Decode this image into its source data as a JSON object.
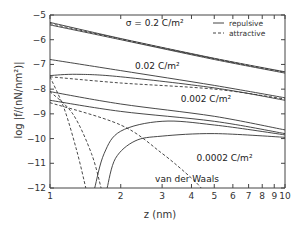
{
  "chart_data": {
    "type": "line",
    "title": "",
    "xlabel": "z (nm)",
    "ylabel": "log |f/(nN/nm²)|",
    "xscale": "log",
    "xlim": [
      1,
      10
    ],
    "ylim": [
      -12,
      -5
    ],
    "x_ticks": [
      "1",
      "2",
      "3",
      "4",
      "5",
      "6",
      "7",
      "8",
      "9",
      "10"
    ],
    "y_ticks": [
      "-5",
      "-6",
      "-7",
      "-8",
      "-9",
      "-10",
      "-11",
      "-12"
    ],
    "grid": false,
    "legend": {
      "position": "upper right",
      "entries": [
        {
          "label": "repulsive",
          "style": "solid"
        },
        {
          "label": "attractive",
          "style": "dashed"
        }
      ]
    },
    "annotations": [
      {
        "text": "σ = 0.2 C/m²",
        "x": 2.1,
        "y": -5.45
      },
      {
        "text": "0.02 C/m²",
        "x": 2.3,
        "y": -7.2
      },
      {
        "text": "0.002 C/m²",
        "x": 3.6,
        "y": -8.5
      },
      {
        "text": "0.0002 C/m²",
        "x": 4.2,
        "y": -10.9
      },
      {
        "text": "van der Waals",
        "x": 2.8,
        "y": -11.75
      }
    ],
    "series": [
      {
        "name": "σ=0.2 repulsive (a)",
        "style": "solid",
        "x": [
          1,
          2,
          5,
          10
        ],
        "y": [
          -5.3,
          -5.95,
          -6.75,
          -7.3
        ]
      },
      {
        "name": "σ=0.2 repulsive (b)",
        "style": "solid",
        "x": [
          1,
          2,
          5,
          10
        ],
        "y": [
          -5.4,
          -6.0,
          -6.8,
          -7.35
        ]
      },
      {
        "name": "σ=0.2 attractive",
        "style": "dashed",
        "x": [
          1,
          2,
          5,
          10
        ],
        "y": [
          -5.35,
          -5.97,
          -6.77,
          -7.32
        ]
      },
      {
        "name": "σ=0.02 repulsive (a)",
        "style": "solid",
        "x": [
          1,
          2,
          5,
          10
        ],
        "y": [
          -6.8,
          -7.25,
          -7.85,
          -8.35
        ]
      },
      {
        "name": "σ=0.02 repulsive (b)",
        "style": "solid",
        "x": [
          1,
          1.3,
          2,
          5,
          10
        ],
        "y": [
          -7.45,
          -7.4,
          -7.5,
          -7.95,
          -8.45
        ]
      },
      {
        "name": "σ=0.02 attractive",
        "style": "dashed",
        "x": [
          1,
          2,
          5,
          10
        ],
        "y": [
          -7.5,
          -7.75,
          -8.0,
          -8.4
        ]
      },
      {
        "name": "σ=0.002 repulsive (a)",
        "style": "solid",
        "x": [
          1,
          2,
          5,
          10
        ],
        "y": [
          -8.1,
          -8.6,
          -9.1,
          -9.65
        ]
      },
      {
        "name": "σ=0.002 repulsive (b)",
        "style": "solid",
        "x": [
          1,
          2,
          5,
          10
        ],
        "y": [
          -8.45,
          -8.9,
          -9.3,
          -9.8
        ]
      },
      {
        "name": "σ=0.002 repulsive curved",
        "style": "solid",
        "x": [
          1.55,
          1.7,
          2,
          3,
          5,
          10
        ],
        "y": [
          -12,
          -10.6,
          -9.7,
          -9.3,
          -9.45,
          -9.85
        ]
      },
      {
        "name": "σ=0.0002 repulsive curved",
        "style": "solid",
        "x": [
          1.75,
          1.9,
          2.3,
          3,
          5,
          10
        ],
        "y": [
          -12,
          -10.8,
          -10.1,
          -9.9,
          -9.8,
          -9.95
        ]
      },
      {
        "name": "attractive steep 1",
        "style": "dashed",
        "x": [
          1,
          1.15,
          1.3,
          1.42
        ],
        "y": [
          -7.5,
          -8.8,
          -10.5,
          -12
        ]
      },
      {
        "name": "attractive steep 2",
        "style": "dashed",
        "x": [
          1,
          1.25,
          1.5,
          1.65
        ],
        "y": [
          -8.1,
          -9.0,
          -10.6,
          -12
        ]
      },
      {
        "name": "van der Waals",
        "style": "dashed",
        "x": [
          1,
          2,
          3,
          4,
          4.4
        ],
        "y": [
          -8.55,
          -9.45,
          -10.6,
          -11.6,
          -12
        ]
      }
    ]
  }
}
